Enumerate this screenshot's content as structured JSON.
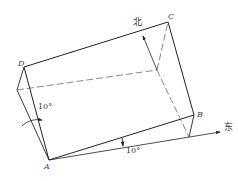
{
  "diagram": {
    "points": {
      "A": "A",
      "B": "B",
      "C": "C",
      "D": "D"
    },
    "directions": {
      "north": "北",
      "east": "东"
    },
    "angles": {
      "tilt": "10°",
      "rotation": "10°"
    },
    "colors": {
      "line": "#222222",
      "hidden": "#555555"
    }
  }
}
